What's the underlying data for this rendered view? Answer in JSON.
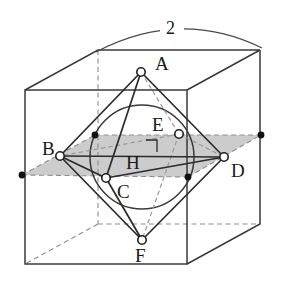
{
  "figure": {
    "dimension_label": "2",
    "labels": {
      "A": "A",
      "B": "B",
      "C": "C",
      "D": "D",
      "E": "E",
      "F": "F",
      "H": "H"
    },
    "colors": {
      "stroke": "#3a3a3a",
      "stroke_dark": "#222222",
      "hidden": "#9a9a9a",
      "plane_fill": "#c9c9c9",
      "vertex_fill": "#ffffff",
      "dot_fill": "#111111",
      "background": "#ffffff"
    },
    "geometry": {
      "cube_front": {
        "x": 25,
        "y": 90,
        "w": 162,
        "h": 174
      },
      "depth_offset": {
        "dx": 73,
        "dy": -40
      },
      "sphere": {
        "cx": 142,
        "cy": 157,
        "r": 52
      },
      "octahedron_vertices": {
        "A": {
          "x": 141,
          "y": 72
        },
        "B": {
          "x": 60,
          "y": 156
        },
        "C": {
          "x": 106,
          "y": 178
        },
        "D": {
          "x": 224,
          "y": 157
        },
        "E": {
          "x": 179,
          "y": 134
        },
        "F": {
          "x": 142,
          "y": 240
        }
      },
      "edge_midpoint_dots": [
        {
          "x": 22,
          "y": 175
        },
        {
          "x": 95,
          "y": 135
        },
        {
          "x": 188,
          "y": 177
        },
        {
          "x": 261,
          "y": 135
        }
      ],
      "right_angle_marker": {
        "x": 146,
        "y": 140,
        "size": 11
      }
    },
    "label_positions": {
      "A": {
        "x": 155,
        "y": 70
      },
      "B": {
        "x": 42,
        "y": 155
      },
      "C": {
        "x": 117,
        "y": 198
      },
      "D": {
        "x": 231,
        "y": 177
      },
      "E": {
        "x": 152,
        "y": 131
      },
      "F": {
        "x": 135,
        "y": 262
      },
      "H": {
        "x": 126,
        "y": 169
      },
      "dimension": {
        "x": 166,
        "y": 32
      }
    }
  }
}
